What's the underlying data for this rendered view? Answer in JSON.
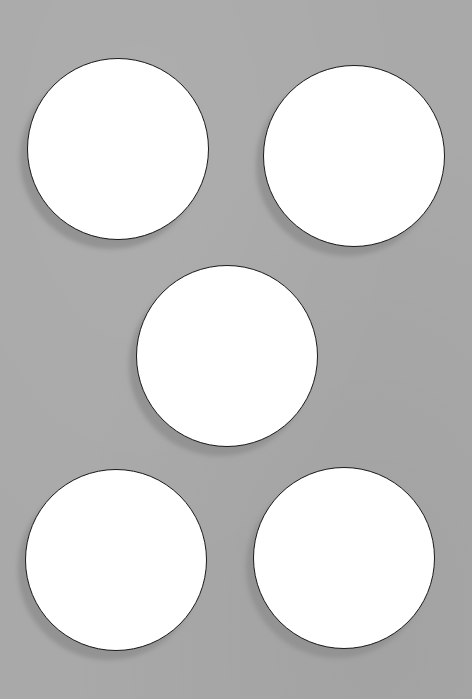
{
  "scene": {
    "description": "Five white paper circles on a gray background, each with a soft shadow to the lower-left",
    "background_color": "#a9a9a9",
    "shadow_color": "#939393",
    "circle_fill": "#ffffff",
    "circle_outline": "#1a1a1a"
  },
  "circles": [
    {
      "id": "top-left",
      "cx": 118,
      "cy": 149,
      "r": 91
    },
    {
      "id": "top-right",
      "cx": 354,
      "cy": 156,
      "r": 91
    },
    {
      "id": "center",
      "cx": 227,
      "cy": 356,
      "r": 91
    },
    {
      "id": "bottom-left",
      "cx": 116,
      "cy": 560,
      "r": 91
    },
    {
      "id": "bottom-right",
      "cx": 344,
      "cy": 558,
      "r": 91
    }
  ],
  "shadow_offset": {
    "dx": -7,
    "dy": 9
  }
}
